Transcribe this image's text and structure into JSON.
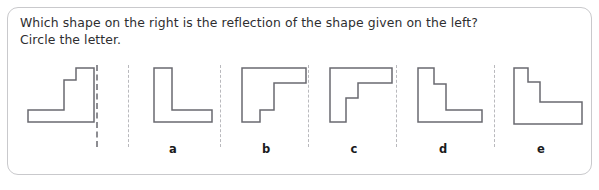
{
  "worksheet": {
    "prompt_line_1": "Which shape on the right is the reflection of the shape given on the left?",
    "prompt_line_2": "Circle the letter.",
    "frame_color": "#c9c9cc",
    "text_color": "#2e2e30",
    "shape_stroke_color": "#6a6a70",
    "shape_fill_color": "#ffffff",
    "divider_color": "#b9b9bd",
    "mirror_line_color": "#8d8d92"
  },
  "reference": {
    "name": "reference-shape",
    "description": "stepped L shape, vertical bar on the right with a step at the top, foot extending to the left",
    "points": "6,60 6,48 42,48 42,18 54,18 54,6 72,6 72,60"
  },
  "options": [
    {
      "letter": "a",
      "name": "option-shape-a",
      "description": "plain L shape, vertical bar on left, foot extending to the right, no step",
      "points": "18,6 18,60 76,60 76,48 36,48 36,6"
    },
    {
      "letter": "b",
      "name": "option-shape-b",
      "description": "mirrored gamma shape, horizontal bar on top with vertical bar on left and a small notch step at the bottom left",
      "points": "14,6 14,60 32,60 32,48 46,48 46,21 78,21 78,6"
    },
    {
      "letter": "c",
      "name": "option-shape-c",
      "description": "gamma shape, horizontal bar on top with vertical bar on left and a step in the inner corner",
      "points": "14,6 14,60 30,60 30,36 42,36 42,21 76,21 76,6"
    },
    {
      "letter": "d",
      "name": "option-shape-d",
      "description": "stepped L shape, vertical bar on the left with a step at the top, foot extending to the right",
      "points": "14,6 14,60 78,60 78,48 42,48 42,22 30,22 30,6"
    },
    {
      "letter": "e",
      "name": "option-shape-e",
      "description": "wide stepped L shape, thick vertical bar on the left with a step at the top, wide foot extending to the right",
      "points": "12,6 12,62 80,62 80,40 38,40 38,20 26,20 26,6"
    }
  ],
  "dividers": [
    {
      "name": "mirror-line",
      "x": 96,
      "strong": true
    },
    {
      "name": "divider-line-1",
      "x": 128,
      "strong": false
    },
    {
      "name": "divider-line-2",
      "x": 220,
      "strong": false
    },
    {
      "name": "divider-line-3",
      "x": 308,
      "strong": false
    },
    {
      "name": "divider-line-4",
      "x": 396,
      "strong": false
    },
    {
      "name": "divider-line-5",
      "x": 494,
      "strong": false
    }
  ]
}
